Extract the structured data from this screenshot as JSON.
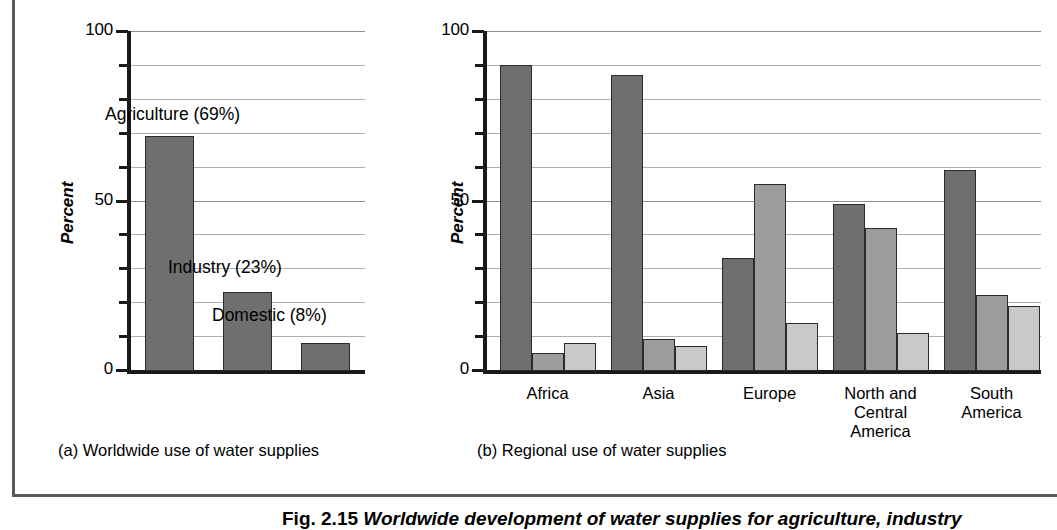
{
  "figure": {
    "caption": "Fig. 2.15 Worldwide development of water supplies for agriculture, industry",
    "caption_label": "Fig. 2.15",
    "caption_text": "Worldwide development of water supplies for agriculture, industry"
  },
  "panel_a": {
    "subcaption": "(a) Worldwide use of water supplies",
    "annotations": [
      "Agriculture (69%)",
      "Industry (23%)",
      "Domestic (8%)"
    ]
  },
  "panel_b": {
    "subcaption": "(b) Regional use of water supplies"
  },
  "colors": {
    "series_agriculture": "#6f6f6f",
    "series_industry": "#9d9d9d",
    "series_domestic": "#c9c9c9",
    "gridline": "#aeaeae",
    "axis": "#1a1a1a",
    "frame_rule": "#5a5a5a"
  },
  "chart_data": [
    {
      "type": "bar",
      "id": "worldwide-use-of-water-supplies",
      "title": "(a) Worldwide use of water supplies",
      "xlabel": "",
      "ylabel": "Percent",
      "ylim": [
        0,
        100
      ],
      "yticks": [
        0,
        50,
        100
      ],
      "ytick_labels": [
        "0",
        "50",
        "100"
      ],
      "minor_tick_step": 10,
      "grid": true,
      "legend": "none",
      "categories": [
        "Agriculture",
        "Industry",
        "Domestic"
      ],
      "values": [
        69,
        23,
        8
      ],
      "data_labels": [
        "Agriculture (69%)",
        "Industry (23%)",
        "Domestic (8%)"
      ]
    },
    {
      "type": "bar",
      "id": "regional-use-of-water-supplies",
      "title": "(b) Regional use of water supplies",
      "xlabel": "",
      "ylabel": "Percent",
      "ylim": [
        0,
        100
      ],
      "yticks": [
        0,
        50,
        100
      ],
      "ytick_labels": [
        "0",
        "50",
        "100"
      ],
      "minor_tick_step": 10,
      "grid": true,
      "legend": "none",
      "categories": [
        "Africa",
        "Asia",
        "Europe",
        "North and\nCentral\nAmerica",
        "South\nAmerica"
      ],
      "series": [
        {
          "name": "Agriculture",
          "values": [
            90,
            87,
            33,
            49,
            59
          ]
        },
        {
          "name": "Industry",
          "values": [
            5,
            9,
            55,
            42,
            22
          ]
        },
        {
          "name": "Domestic",
          "values": [
            8,
            7,
            14,
            11,
            19
          ]
        }
      ]
    }
  ]
}
